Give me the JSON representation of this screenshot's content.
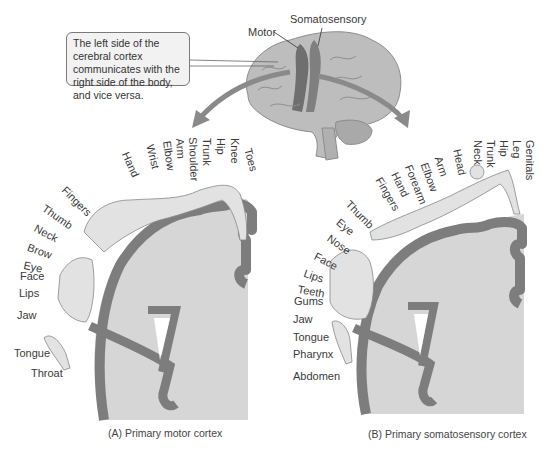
{
  "callout": {
    "text": "The left side of the cerebral cortex communicates with the right side of the body, and vice versa."
  },
  "brain_labels": {
    "motor": "Motor",
    "somatosensory": "Somatosensory"
  },
  "panel_a": {
    "caption": "(A)  Primary motor cortex",
    "labels": [
      "Toes",
      "Knee",
      "Hip",
      "Trunk",
      "Shoulder",
      "Arm",
      "Elbow",
      "Wrist",
      "Hand",
      "Fingers",
      "Thumb",
      "Neck",
      "Brow",
      "Eye",
      "Face",
      "Lips",
      "Jaw",
      "Tongue",
      "Throat"
    ]
  },
  "panel_b": {
    "caption": "(B)  Primary somatosensory cortex",
    "labels": [
      "Genitals",
      "Leg",
      "Hip",
      "Trunk",
      "Neck",
      "Head",
      "Arm",
      "Elbow",
      "Forearm",
      "Hand",
      "Fingers",
      "Thumb",
      "Eye",
      "Nose",
      "Face",
      "Lips",
      "Teeth",
      "Gums",
      "Jaw",
      "Tongue",
      "Pharynx",
      "Abdomen"
    ]
  },
  "colors": {
    "cortex_fill": "#d6d6d6",
    "gray_matter": "#7d7d7d",
    "brain_fill": "#bdbdbd",
    "highlight_strip": "#6f6f6f",
    "arrow": "#8a8a8a"
  }
}
